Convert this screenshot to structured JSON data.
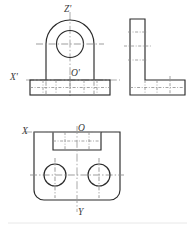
{
  "drawing": {
    "title": "Three-view orthographic projection of a bracket",
    "paper_color": "#ffffff",
    "line_color": "#2b2b2b",
    "center_line_color": "#8d8d8d",
    "axis_label_color": "#3a3a3a",
    "views": [
      {
        "id": "front-view",
        "name": "Front view (auxiliary projection)",
        "position": "top-left",
        "features": [
          "semicircular arch boss",
          "central bore circle",
          "rectangular base plate",
          "section grid ticks on base"
        ],
        "axis_labels": [
          "Z'",
          "X'",
          "O'"
        ]
      },
      {
        "id": "side-view",
        "name": "Side view",
        "position": "top-right",
        "features": [
          "L-shaped profile",
          "vertical web",
          "horizontal base flange",
          "center line marks"
        ],
        "axis_labels": []
      },
      {
        "id": "top-view",
        "name": "Top view",
        "position": "bottom-left",
        "features": [
          "rectangular outline with rounded lower corners",
          "rectangular slot at top edge",
          "two bolt holes",
          "vertical and horizontal center lines"
        ],
        "axis_labels": [
          "X",
          "O",
          "Y"
        ]
      }
    ],
    "labels": {
      "z_prime": "Z'",
      "x_prime": "X'",
      "o_prime": "O'",
      "x": "X",
      "o": "O",
      "y": "Y"
    }
  }
}
